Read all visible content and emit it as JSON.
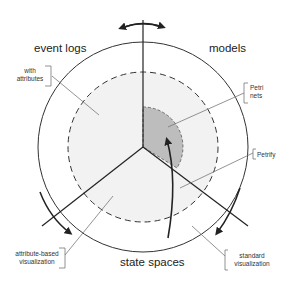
{
  "diagram": {
    "sectors": [
      {
        "id": "event-logs",
        "label": "event logs"
      },
      {
        "id": "models",
        "label": "models"
      },
      {
        "id": "state-spaces",
        "label": "state spaces"
      }
    ],
    "annotations": [
      {
        "id": "with-attributes",
        "line1": "with",
        "line2": "attributes"
      },
      {
        "id": "petri-nets",
        "line1": "Petri",
        "line2": "nets"
      },
      {
        "id": "petrify",
        "line1": "Petrify"
      },
      {
        "id": "attribute-based-visualization",
        "line1": "attribute-based",
        "line2": "visualization"
      },
      {
        "id": "standard-visualization",
        "line1": "standard",
        "line2": "visualization"
      }
    ],
    "colors": {
      "line": "#222222",
      "light_fill": "#f0f0f0",
      "dark_fill": "#bdbdbd",
      "annotation_line": "#777777"
    }
  }
}
